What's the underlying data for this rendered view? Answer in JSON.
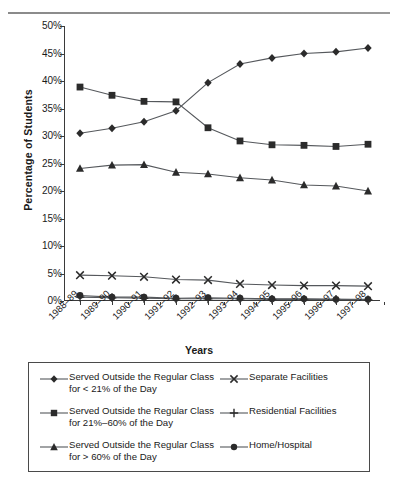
{
  "chart_data": {
    "type": "line",
    "title": "",
    "xlabel": "Years",
    "ylabel": "Percentage of Students",
    "ylim": [
      0,
      50
    ],
    "yticks": [
      "0%",
      "5%",
      "10%",
      "15%",
      "20%",
      "25%",
      "30%",
      "35%",
      "40%",
      "45%",
      "50%"
    ],
    "ytick_values": [
      0,
      5,
      10,
      15,
      20,
      25,
      30,
      35,
      40,
      45,
      50
    ],
    "grid": false,
    "legend_position": "below-plot",
    "categories": [
      "1988–89",
      "1989–90",
      "1990–91",
      "1991–92",
      "1992–93",
      "1993–94",
      "1994–95",
      "1995–96",
      "1996–97",
      "1997–98"
    ],
    "series": [
      {
        "name": "Served Outside the Regular Class\nfor < 21% of the Day",
        "marker": "diamond",
        "values": [
          30.5,
          31.4,
          32.6,
          34.6,
          39.7,
          43.1,
          44.2,
          45.0,
          45.3,
          46.0
        ]
      },
      {
        "name": "Served Outside the Regular Class\nfor 21%–60% of the Day",
        "marker": "square",
        "values": [
          38.9,
          37.4,
          36.3,
          36.2,
          31.5,
          29.1,
          28.4,
          28.3,
          28.1,
          28.5
        ]
      },
      {
        "name": "Served Outside the Regular Class\nfor > 60% of the Day",
        "marker": "triangle",
        "values": [
          24.1,
          24.7,
          24.8,
          23.4,
          23.1,
          22.4,
          22.0,
          21.1,
          20.9,
          20.0
        ]
      },
      {
        "name": "Separate Facilities",
        "marker": "cross",
        "values": [
          4.7,
          4.6,
          4.4,
          3.9,
          3.8,
          3.1,
          2.9,
          2.8,
          2.8,
          2.7
        ]
      },
      {
        "name": "Residential Facilities",
        "marker": "plus",
        "values": [
          0.7,
          0.6,
          0.5,
          0.4,
          0.4,
          0.4,
          0.3,
          0.3,
          0.3,
          0.2
        ]
      },
      {
        "name": "Home/Hospital",
        "marker": "circle",
        "values": [
          1.0,
          0.7,
          0.7,
          0.5,
          0.6,
          0.5,
          0.4,
          0.4,
          0.3,
          0.3
        ]
      }
    ]
  },
  "legend": {
    "items": [
      {
        "label": "Served Outside the Regular Class\nfor < 21% of the Day",
        "marker": "diamond"
      },
      {
        "label": "Separate Facilities",
        "marker": "cross"
      },
      {
        "label": "Served Outside the Regular Class\nfor 21%–60% of the Day",
        "marker": "square"
      },
      {
        "label": "Residential Facilities",
        "marker": "plus"
      },
      {
        "label": "Served Outside the Regular Class\nfor > 60% of the Day",
        "marker": "triangle"
      },
      {
        "label": "Home/Hospital",
        "marker": "circle"
      }
    ]
  },
  "colors": {
    "ink": "#1a1a1a",
    "axis": "#3a3a3a",
    "line": "#55585c",
    "marker": "#2b2b2b",
    "border": "#4a4a4a"
  }
}
